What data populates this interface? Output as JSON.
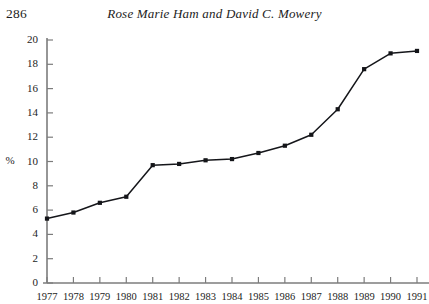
{
  "page": {
    "folio": "286",
    "running_head": "Rose Marie Ham and David C. Mowery"
  },
  "chart_data": {
    "type": "line",
    "title": "",
    "xlabel": "",
    "ylabel": "%",
    "categories": [
      "1977",
      "1978",
      "1979",
      "1980",
      "1981",
      "1982",
      "1983",
      "1984",
      "1985",
      "1986",
      "1987",
      "1988",
      "1989",
      "1990",
      "1991"
    ],
    "x": [
      1977,
      1978,
      1979,
      1980,
      1981,
      1982,
      1983,
      1984,
      1985,
      1986,
      1987,
      1988,
      1989,
      1990,
      1991
    ],
    "values": [
      5.3,
      5.8,
      6.6,
      7.1,
      9.7,
      9.8,
      10.1,
      10.2,
      10.7,
      11.3,
      12.2,
      14.3,
      17.6,
      18.9,
      19.1
    ],
    "series": [
      {
        "name": "",
        "values": [
          5.3,
          5.8,
          6.6,
          7.1,
          9.7,
          9.8,
          10.1,
          10.2,
          10.7,
          11.3,
          12.2,
          14.3,
          17.6,
          18.9,
          19.1
        ]
      }
    ],
    "ylim": [
      0,
      20
    ],
    "ytick_labels": [
      "0",
      "2",
      "4",
      "6",
      "8",
      "10",
      "12",
      "14",
      "16",
      "18",
      "20"
    ],
    "ytick_values": [
      0,
      2,
      4,
      6,
      8,
      10,
      12,
      14,
      16,
      18,
      20
    ],
    "xtick_labels": [
      "1977",
      "1978",
      "1979",
      "1980",
      "1981",
      "1982",
      "1983",
      "1984",
      "1985",
      "1986",
      "1987",
      "1988",
      "1989",
      "1990",
      "1991"
    ],
    "grid": false,
    "legend": false,
    "marker": "square",
    "line_color": "#141519",
    "axis_color": "#7c7c7c"
  }
}
